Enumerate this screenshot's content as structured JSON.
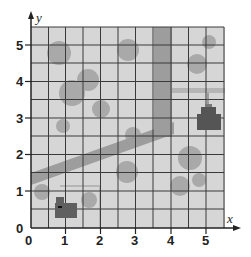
{
  "figure": {
    "type": "coordinate-grid-map",
    "x_axis_label": "x",
    "y_axis_label": "y",
    "x_ticks": [
      "0",
      "1",
      "2",
      "3",
      "4",
      "5"
    ],
    "y_ticks": [
      "0",
      "1",
      "2",
      "3",
      "4",
      "5"
    ],
    "x_range": [
      0,
      5.5
    ],
    "y_range": [
      0,
      5.5
    ],
    "grid_step": 0.5,
    "colors": {
      "background": "#d6d6d6",
      "grid": "#333333",
      "road": "#9a9a9a",
      "tree": "#a8a8a8",
      "building": "#5a5a5a"
    },
    "features": {
      "roads": [
        {
          "name": "diagonal-road",
          "from": [
            0,
            1.5
          ],
          "to": [
            4,
            2.8
          ]
        },
        {
          "name": "vertical-road",
          "x": 3.75,
          "from_y": 2.4,
          "to_y": 5.5
        }
      ],
      "buildings": [
        {
          "name": "building-lower-left",
          "at": [
            1,
            0.6
          ]
        },
        {
          "name": "building-right",
          "at": [
            5,
            3
          ]
        }
      ]
    }
  }
}
